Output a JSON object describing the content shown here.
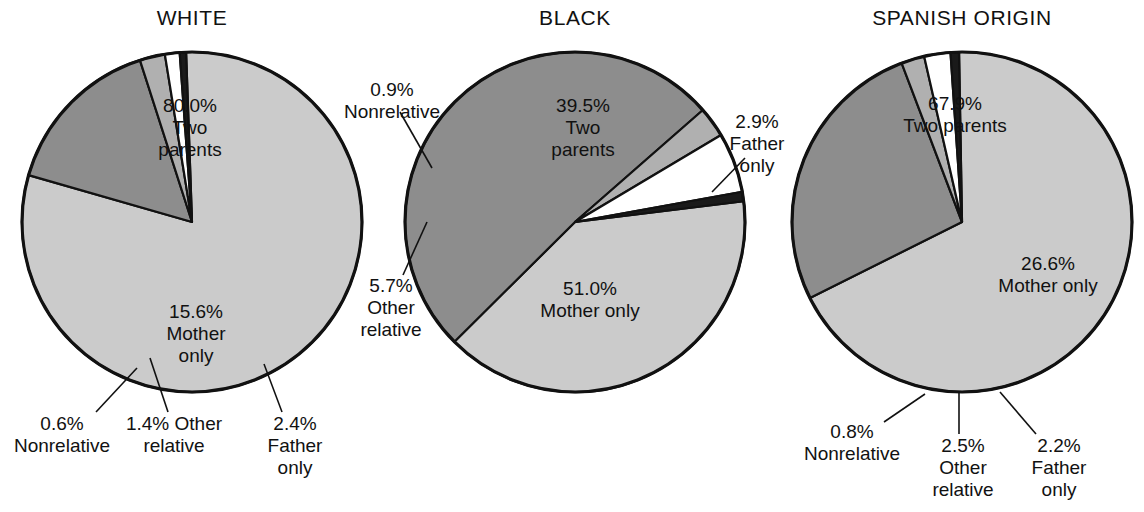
{
  "figure": {
    "background": "#ffffff",
    "width": 1144,
    "height": 512
  },
  "palette": {
    "two_parents": "#cbcbcb",
    "mother_only": "#8d8d8d",
    "father_only": "#b0b0b0",
    "other_relative": "#ffffff",
    "nonrelative": "#1a1a1a",
    "outline": "#111111",
    "text": "#111111"
  },
  "panels": [
    {
      "title": "WHITE",
      "title_x": 192,
      "title_y": 25,
      "cx": 192,
      "cy": 222,
      "r": 170,
      "start_angle": -92.0,
      "labels": [
        {
          "name": "two-parents",
          "lines": [
            "80.0%",
            "Two",
            "parents"
          ],
          "x": 190,
          "y": 112,
          "anchor": "mid",
          "leader": null
        },
        {
          "name": "mother-only",
          "lines": [
            "15.6%",
            "Mother",
            "only"
          ],
          "x": 196,
          "y": 318,
          "anchor": "mid",
          "leader": null
        },
        {
          "name": "nonrelative",
          "lines": [
            "0.6%",
            "Nonrelative"
          ],
          "x": 62,
          "y": 430,
          "anchor": "mid",
          "leader": [
            [
              96,
              412
            ],
            [
              137,
              368
            ]
          ]
        },
        {
          "name": "other-relative",
          "lines": [
            "1.4% Other",
            "relative"
          ],
          "x": 174,
          "y": 430,
          "anchor": "mid",
          "leader": [
            [
              168,
              412
            ],
            [
              150,
              358
            ]
          ]
        },
        {
          "name": "father-only",
          "lines": [
            "2.4%",
            "Father",
            "only"
          ],
          "x": 295,
          "y": 430,
          "anchor": "mid",
          "leader": [
            [
              282,
              412
            ],
            [
              264,
              364
            ]
          ]
        }
      ]
    },
    {
      "title": "BLACK",
      "title_x": 575,
      "title_y": 25,
      "cx": 575,
      "cy": 222,
      "r": 170,
      "start_angle": -7.0,
      "labels": [
        {
          "name": "two-parents",
          "lines": [
            "39.5%",
            "Two",
            "parents"
          ],
          "x": 583,
          "y": 112,
          "anchor": "mid",
          "leader": null
        },
        {
          "name": "mother-only",
          "lines": [
            "51.0%",
            "Mother only"
          ],
          "x": 590,
          "y": 295,
          "anchor": "mid",
          "leader": null
        },
        {
          "name": "nonrelative",
          "lines": [
            "0.9%",
            "Nonrelative"
          ],
          "x": 392,
          "y": 96,
          "anchor": "mid",
          "leader": [
            [
              400,
              112
            ],
            [
              432,
              168
            ]
          ]
        },
        {
          "name": "other-relative",
          "lines": [
            "5.7%",
            "Other",
            "relative"
          ],
          "x": 391,
          "y": 292,
          "anchor": "mid",
          "leader": [
            [
              403,
              275
            ],
            [
              427,
              222
            ]
          ]
        },
        {
          "name": "father-only",
          "lines": [
            "2.9%",
            "Father",
            "only"
          ],
          "x": 757,
          "y": 128,
          "anchor": "mid",
          "leader": [
            [
              745,
              158
            ],
            [
              712,
              192
            ]
          ]
        }
      ]
    },
    {
      "title": "SPANISH ORIGIN",
      "title_x": 962,
      "title_y": 25,
      "cx": 962,
      "cy": 222,
      "r": 170,
      "start_angle": -91.0,
      "labels": [
        {
          "name": "two-parents",
          "lines": [
            "67.9%",
            "Two parents"
          ],
          "x": 955,
          "y": 110,
          "anchor": "mid",
          "leader": null
        },
        {
          "name": "mother-only",
          "lines": [
            "26.6%",
            "Mother only"
          ],
          "x": 1048,
          "y": 270,
          "anchor": "mid",
          "leader": null
        },
        {
          "name": "nonrelative",
          "lines": [
            "0.8%",
            "Nonrelative"
          ],
          "x": 852,
          "y": 438,
          "anchor": "mid",
          "leader": [
            [
              884,
              422
            ],
            [
              925,
              394
            ]
          ]
        },
        {
          "name": "other-relative",
          "lines": [
            "2.5%",
            "Other",
            "relative"
          ],
          "x": 963,
          "y": 452,
          "anchor": "mid",
          "leader": [
            [
              959,
              434
            ],
            [
              959,
              392
            ]
          ]
        },
        {
          "name": "father-only",
          "lines": [
            "2.2%",
            "Father",
            "only"
          ],
          "x": 1059,
          "y": 452,
          "anchor": "mid",
          "leader": [
            [
              1036,
              434
            ],
            [
              1000,
              392
            ]
          ]
        }
      ]
    }
  ],
  "chart_data": {
    "type": "pie",
    "categories": [
      "Two parents",
      "Mother only",
      "Father only",
      "Other relative",
      "Nonrelative"
    ],
    "unit": "%",
    "series": [
      {
        "name": "WHITE",
        "values": [
          80.0,
          15.6,
          2.4,
          1.4,
          0.6
        ],
        "labels": [
          "80.0%",
          "15.6%",
          "2.4%",
          "1.4%",
          "0.6%"
        ]
      },
      {
        "name": "BLACK",
        "values": [
          39.5,
          51.0,
          2.9,
          5.7,
          0.9
        ],
        "labels": [
          "39.5%",
          "51.0%",
          "2.9%",
          "5.7%",
          "0.9%"
        ]
      },
      {
        "name": "SPANISH ORIGIN",
        "values": [
          67.9,
          26.6,
          2.2,
          2.5,
          0.8
        ],
        "labels": [
          "67.9%",
          "26.6%",
          "2.2%",
          "2.5%",
          "0.8%"
        ]
      }
    ],
    "slice_colors": {
      "Two parents": "#cbcbcb",
      "Mother only": "#8d8d8d",
      "Father only": "#b0b0b0",
      "Other relative": "#ffffff",
      "Nonrelative": "#1a1a1a"
    },
    "legend": "none",
    "grid": false
  }
}
